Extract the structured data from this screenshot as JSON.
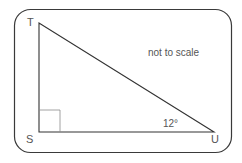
{
  "diagram": {
    "type": "right-triangle",
    "note": "not to scale",
    "vertices": {
      "T": {
        "label": "T"
      },
      "S": {
        "label": "S"
      },
      "U": {
        "label": "U"
      }
    },
    "angle_label": "12°",
    "angle_at": "U",
    "right_angle_at": "S",
    "colors": {
      "frame": "#3a3a3a",
      "triangle": "#333333",
      "right_angle_marker": "#888888",
      "text": "#555555"
    }
  }
}
